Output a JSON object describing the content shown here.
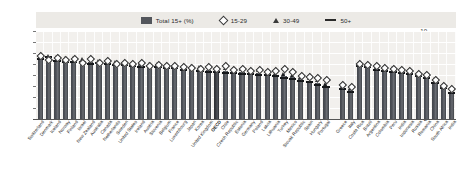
{
  "legend": {
    "items": [
      {
        "label": "Total 15+ (%)",
        "marker": "bar-swatch-icon",
        "color": "#53565c"
      },
      {
        "label": "15-29",
        "marker": "diamond-icon",
        "color": "#3a3a3a"
      },
      {
        "label": "30-49",
        "marker": "triangle-icon",
        "color": "#3a3a3a"
      },
      {
        "label": "50+",
        "marker": "dash-icon",
        "color": "#2a2a2a"
      }
    ]
  },
  "chart_data": {
    "type": "bar",
    "title": "",
    "subtitle": "",
    "xlabel": "",
    "ylabel": "",
    "ylim": [
      2,
      10
    ],
    "yticks": [
      2,
      3,
      4,
      5,
      6,
      7,
      8,
      9,
      10
    ],
    "grid": true,
    "legend_position": "top-center",
    "group_gap_after_index": 34,
    "categories": [
      "Switzerland",
      "Denmark",
      "Iceland",
      "Norway",
      "Finland",
      "Israel",
      "New Zealand",
      "Australia",
      "Canada",
      "Netherlands",
      "Sweden",
      "United States",
      "Ireland",
      "Austria",
      "Slovenia",
      "Belgium",
      "France",
      "Luxembourg",
      "Japan",
      "Korea",
      "United Kingdom",
      "OECD",
      "Chile",
      "Czech Republic",
      "Estonia",
      "Germany",
      "Poland",
      "Latvia",
      "Lithuania",
      "Turkey",
      "Mexico",
      "Slovak Republic",
      "Spain",
      "Hungary",
      "Portugal",
      "Greece",
      "Italy",
      "Costa Rica",
      "Brazil",
      "Argentina",
      "Colombia",
      "Peru",
      "India",
      "Indonesia",
      "Russia",
      "Romania",
      "China",
      "South Africa",
      "India"
    ],
    "series": [
      {
        "name": "Total 15+ (%)",
        "marker": "bar",
        "values": [
          7.6,
          7.5,
          7.4,
          7.3,
          7.3,
          7.2,
          7.2,
          7.1,
          7.1,
          7.0,
          7.0,
          6.9,
          6.9,
          6.8,
          6.8,
          6.7,
          6.7,
          6.6,
          6.6,
          6.5,
          6.5,
          6.4,
          6.4,
          6.3,
          6.3,
          6.2,
          6.2,
          6.1,
          6.0,
          5.9,
          5.8,
          5.6,
          5.5,
          5.3,
          5.0,
          4.8,
          4.6,
          6.9,
          6.8,
          6.6,
          6.5,
          6.4,
          6.3,
          6.2,
          6.0,
          5.8,
          5.4,
          4.9,
          4.5
        ]
      },
      {
        "name": "15-29",
        "marker": "diamond",
        "values": [
          7.8,
          7.4,
          7.6,
          7.4,
          7.5,
          7.2,
          7.5,
          7.2,
          7.3,
          7.1,
          7.2,
          7.1,
          7.2,
          6.9,
          7.0,
          6.9,
          6.9,
          6.8,
          6.7,
          6.6,
          6.8,
          6.6,
          6.9,
          6.5,
          6.6,
          6.4,
          6.5,
          6.3,
          6.4,
          6.6,
          6.3,
          6.0,
          5.9,
          5.8,
          5.6,
          5.2,
          5.0,
          7.1,
          7.0,
          6.9,
          6.7,
          6.6,
          6.5,
          6.4,
          6.2,
          6.1,
          5.6,
          5.1,
          4.8
        ]
      },
      {
        "name": "30-49",
        "marker": "triangle",
        "values": [
          7.6,
          7.5,
          7.4,
          7.3,
          7.3,
          7.2,
          7.2,
          7.1,
          7.1,
          7.0,
          7.0,
          6.9,
          6.9,
          6.8,
          6.8,
          6.7,
          6.7,
          6.6,
          6.6,
          6.5,
          6.5,
          6.4,
          6.4,
          6.3,
          6.3,
          6.2,
          6.2,
          6.1,
          6.0,
          5.9,
          5.8,
          5.6,
          5.5,
          5.3,
          5.0,
          4.8,
          4.6,
          6.9,
          6.8,
          6.6,
          6.5,
          6.4,
          6.3,
          6.2,
          6.0,
          5.8,
          5.4,
          4.9,
          4.5
        ]
      },
      {
        "name": "50+",
        "marker": "dash",
        "values": [
          7.5,
          7.6,
          7.3,
          7.2,
          7.2,
          7.2,
          7.0,
          7.1,
          7.0,
          6.9,
          6.9,
          6.8,
          6.7,
          6.8,
          6.7,
          6.6,
          6.6,
          6.5,
          6.6,
          6.4,
          6.3,
          6.3,
          6.2,
          6.2,
          6.1,
          6.1,
          6.0,
          6.0,
          5.9,
          5.7,
          5.6,
          5.5,
          5.4,
          5.1,
          4.9,
          4.7,
          4.5,
          6.8,
          6.7,
          6.5,
          6.4,
          6.3,
          6.2,
          6.1,
          5.9,
          5.7,
          5.3,
          4.8,
          4.4
        ]
      }
    ]
  }
}
